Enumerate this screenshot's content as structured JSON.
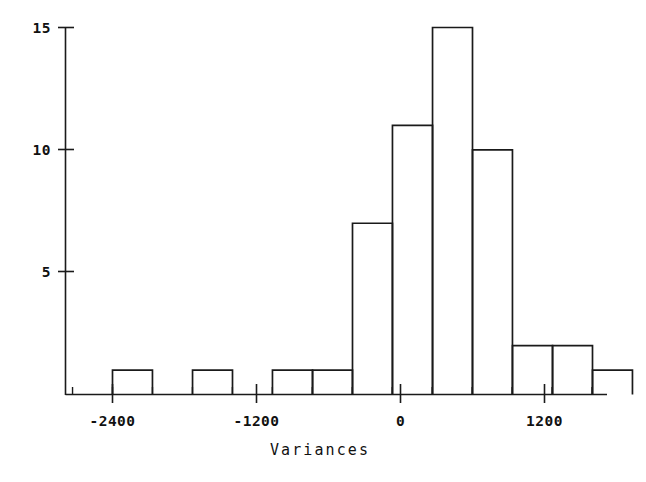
{
  "chart_data": {
    "type": "bar",
    "title": "",
    "subtitle": "",
    "xlabel": "Variances",
    "ylabel": "",
    "grid": false,
    "legend": null,
    "xlim": [
      -2733,
      1733
    ],
    "ylim": [
      0,
      15
    ],
    "bin_width": 333,
    "x_ticks_major": [
      -2400,
      -1200,
      0,
      1200
    ],
    "x_tick_labels": [
      "-2400",
      "-1200",
      "0",
      "1200"
    ],
    "y_ticks_major": [
      5,
      10,
      15
    ],
    "y_tick_labels": [
      "5",
      "10",
      "15"
    ],
    "bins": [
      {
        "left": -2400,
        "right": -2067,
        "count": 1
      },
      {
        "left": -2067,
        "right": -1733,
        "count": 0
      },
      {
        "left": -1733,
        "right": -1400,
        "count": 1
      },
      {
        "left": -1400,
        "right": -1067,
        "count": 0
      },
      {
        "left": -1067,
        "right": -733,
        "count": 1
      },
      {
        "left": -733,
        "right": -400,
        "count": 1
      },
      {
        "left": -400,
        "right": -67,
        "count": 7
      },
      {
        "left": -67,
        "right": 267,
        "count": 11
      },
      {
        "left": 267,
        "right": 600,
        "count": 15
      },
      {
        "left": 600,
        "right": 933,
        "count": 10
      },
      {
        "left": 933,
        "right": 1267,
        "count": 2
      },
      {
        "left": 1267,
        "right": 1600,
        "count": 2
      },
      {
        "left": 1600,
        "right": 1933,
        "count": 1
      }
    ],
    "categories": [
      "-2400",
      "-2067",
      "-1733",
      "-1400",
      "-1067",
      "-733",
      "-400",
      "-67",
      "267",
      "600",
      "933",
      "1267",
      "1600"
    ],
    "values": [
      1,
      0,
      1,
      0,
      1,
      1,
      7,
      11,
      15,
      10,
      2,
      2,
      1
    ],
    "colors": {
      "stroke": "#1a1a1a",
      "fill": "none",
      "background": "#ffffff"
    }
  }
}
